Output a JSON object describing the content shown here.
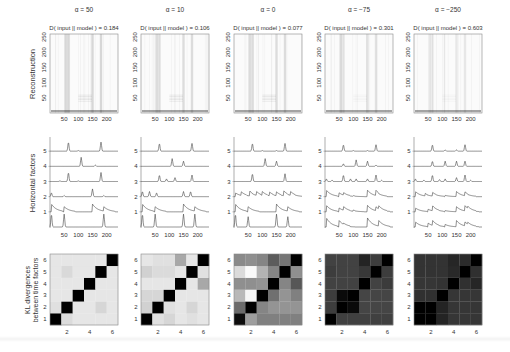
{
  "figure": {
    "row_labels": {
      "reconstruction": "Reconstruction",
      "horizontal_factors": "Horizontal factors",
      "kl_line1": "KL divergences",
      "kl_line2": "between time factors"
    },
    "columns": [
      {
        "alpha_label": "α = 50",
        "divergence_label": "D( input || model ) = 0.184"
      },
      {
        "alpha_label": "α = 10",
        "divergence_label": "D( input || model ) = 0.106"
      },
      {
        "alpha_label": "α = 0",
        "divergence_label": "D( input || model ) = 0.077"
      },
      {
        "alpha_label": "α = −75",
        "divergence_label": "D( input || model ) = 0.301"
      },
      {
        "alpha_label": "α = −250",
        "divergence_label": "D( input || model ) = 0.603"
      }
    ]
  },
  "chart_data": [
    {
      "type": "heatmap",
      "title": "Reconstruction",
      "panels": [
        "α = 50",
        "α = 10",
        "α = 0",
        "α = −75",
        "α = −250"
      ],
      "divergence": [
        0.184,
        0.106,
        0.077,
        0.301,
        0.603
      ],
      "xticks": [
        50,
        100,
        150,
        200
      ],
      "yticks": [
        50,
        100,
        150,
        200,
        250
      ],
      "xlim": [
        0,
        240
      ],
      "ylim": [
        0,
        260
      ],
      "dark_columns_x": [
        55,
        65,
        150,
        180
      ],
      "colormap": "gray (white = low)"
    },
    {
      "type": "line",
      "title": "Horizontal factors",
      "ylabel": "Horizontal factors",
      "yticks": [
        1,
        2,
        3,
        4,
        5
      ],
      "xticks": [
        50,
        100,
        150,
        200
      ],
      "xlim": [
        0,
        240
      ],
      "note": "Six stacked traces per panel (bottom unlabeled trace is the spike input); peak positions per trace estimated",
      "series": [
        {
          "panel": "α = 50",
          "traces": {
            "0": [
              [
                5,
                1
              ],
              [
                50,
                1
              ],
              [
                190,
                1
              ]
            ],
            "1": [
              [
                5,
                0.6
              ],
              [
                50,
                0.4
              ],
              [
                150,
                0.6
              ],
              [
                190,
                0.4
              ]
            ],
            "2": [
              [
                5,
                0.3
              ],
              [
                50,
                0.1
              ],
              [
                150,
                0.6
              ],
              [
                190,
                0.1
              ]
            ],
            "3": [
              [
                65,
                0.7
              ],
              [
                180,
                0.7
              ],
              [
                35,
                0.05
              ],
              [
                100,
                0.05
              ]
            ],
            "4": [
              [
                110,
                0.7
              ],
              [
                160,
                0.1
              ]
            ],
            "5": [
              [
                65,
                0.7
              ],
              [
                180,
                0.7
              ],
              [
                100,
                0.05
              ]
            ]
          }
        },
        {
          "panel": "α = 10",
          "traces": {
            "0": [
              [
                5,
                1
              ],
              [
                50,
                1
              ],
              [
                150,
                1
              ],
              [
                190,
                1
              ]
            ],
            "1": [
              [
                5,
                0.6
              ],
              [
                50,
                0.4
              ],
              [
                150,
                0.6
              ],
              [
                190,
                0.4
              ]
            ],
            "2": [
              [
                5,
                0.4
              ],
              [
                30,
                0.4
              ],
              [
                55,
                0.3
              ],
              [
                150,
                0.4
              ],
              [
                175,
                0.4
              ]
            ],
            "3": [
              [
                65,
                0.5
              ],
              [
                90,
                0.2
              ],
              [
                120,
                0.3
              ],
              [
                180,
                0.5
              ]
            ],
            "4": [
              [
                110,
                0.6
              ],
              [
                150,
                0.4
              ]
            ],
            "5": [
              [
                65,
                0.6
              ],
              [
                180,
                0.6
              ]
            ]
          }
        },
        {
          "panel": "α = 0",
          "traces": {
            "0": [
              [
                5,
                1
              ],
              [
                50,
                0.8
              ],
              [
                150,
                1
              ],
              [
                190,
                0.8
              ]
            ],
            "1": [
              [
                5,
                0.6
              ],
              [
                50,
                0.4
              ],
              [
                150,
                0.6
              ],
              [
                190,
                0.4
              ]
            ],
            "2": [
              [
                5,
                0.3
              ],
              [
                25,
                0.3
              ],
              [
                55,
                0.4
              ],
              [
                80,
                0.3
              ],
              [
                100,
                0.3
              ],
              [
                125,
                0.3
              ],
              [
                150,
                0.3
              ],
              [
                175,
                0.4
              ],
              [
                200,
                0.3
              ]
            ],
            "3": [
              [
                65,
                0.6
              ],
              [
                180,
                0.6
              ]
            ],
            "4": [
              [
                110,
                0.6
              ],
              [
                150,
                0.4
              ]
            ],
            "5": [
              [
                65,
                0.6
              ],
              [
                100,
                0.05
              ],
              [
                150,
                0.05
              ],
              [
                180,
                0.6
              ]
            ]
          }
        },
        {
          "panel": "α = −75",
          "traces": {
            "0": [
              [
                5,
                0.7
              ],
              [
                50,
                0.5
              ],
              [
                65,
                0.1
              ],
              [
                150,
                0.7
              ],
              [
                190,
                0.5
              ]
            ],
            "1": [
              [
                5,
                0.5
              ],
              [
                50,
                0.3
              ],
              [
                65,
                0.3
              ],
              [
                100,
                0.1
              ],
              [
                150,
                0.5
              ],
              [
                180,
                0.3
              ],
              [
                190,
                0.3
              ]
            ],
            "2": [
              [
                5,
                0.5
              ],
              [
                50,
                0.3
              ],
              [
                65,
                0.2
              ],
              [
                100,
                0.05
              ],
              [
                150,
                0.5
              ],
              [
                180,
                0.4
              ]
            ],
            "3": [
              [
                5,
                0.2
              ],
              [
                25,
                0.1
              ],
              [
                65,
                0.5
              ],
              [
                90,
                0.2
              ],
              [
                110,
                0.2
              ],
              [
                150,
                0.2
              ],
              [
                180,
                0.5
              ],
              [
                200,
                0.1
              ]
            ],
            "4": [
              [
                65,
                0.2
              ],
              [
                110,
                0.5
              ],
              [
                150,
                0.4
              ],
              [
                180,
                0.1
              ]
            ],
            "5": [
              [
                65,
                0.5
              ],
              [
                100,
                0.05
              ],
              [
                150,
                0.05
              ],
              [
                180,
                0.5
              ]
            ]
          }
        },
        {
          "panel": "α = −250",
          "traces": {
            "0": [
              [
                5,
                0.4
              ],
              [
                50,
                0.3
              ],
              [
                65,
                0.4
              ],
              [
                110,
                0.2
              ],
              [
                150,
                0.5
              ],
              [
                180,
                0.3
              ],
              [
                190,
                0.2
              ]
            ],
            "1": [
              [
                5,
                0.3
              ],
              [
                50,
                0.2
              ],
              [
                65,
                0.4
              ],
              [
                110,
                0.1
              ],
              [
                150,
                0.4
              ],
              [
                180,
                0.4
              ],
              [
                190,
                0.2
              ]
            ],
            "2": [
              [
                5,
                0.4
              ],
              [
                40,
                0.2
              ],
              [
                65,
                0.3
              ],
              [
                110,
                0.1
              ],
              [
                150,
                0.4
              ],
              [
                180,
                0.3
              ]
            ],
            "3": [
              [
                5,
                0.2
              ],
              [
                35,
                0.1
              ],
              [
                65,
                0.5
              ],
              [
                90,
                0.15
              ],
              [
                110,
                0.2
              ],
              [
                150,
                0.3
              ],
              [
                180,
                0.5
              ],
              [
                200,
                0.1
              ]
            ],
            "4": [
              [
                65,
                0.4
              ],
              [
                110,
                0.4
              ],
              [
                150,
                0.4
              ],
              [
                180,
                0.4
              ]
            ],
            "5": [
              [
                65,
                0.5
              ],
              [
                110,
                0.1
              ],
              [
                150,
                0.1
              ],
              [
                180,
                0.5
              ]
            ]
          }
        }
      ]
    },
    {
      "type": "heatmap",
      "title": "KL divergences between time factors",
      "xticks": [
        2,
        4,
        6
      ],
      "yticks": [
        1,
        2,
        3,
        4,
        5,
        6
      ],
      "note": "Grey level per cell (0 = black, 1 = white); rows listed from factor 1 (bottom) to 6 (top)",
      "matrices": [
        {
          "panel": "α = 50",
          "values": [
            [
              0.0,
              0.86,
              0.9,
              0.9,
              0.9,
              0.9
            ],
            [
              0.88,
              0.0,
              0.9,
              0.9,
              0.84,
              0.9
            ],
            [
              0.9,
              0.9,
              0.0,
              0.9,
              0.9,
              0.9
            ],
            [
              0.9,
              0.9,
              0.9,
              0.0,
              0.9,
              0.9
            ],
            [
              0.9,
              0.85,
              0.9,
              0.9,
              0.0,
              0.9
            ],
            [
              0.9,
              0.9,
              0.9,
              0.9,
              0.9,
              0.0
            ]
          ]
        },
        {
          "panel": "α = 10",
          "values": [
            [
              0.0,
              0.88,
              0.84,
              0.9,
              0.88,
              0.9
            ],
            [
              0.82,
              0.0,
              0.88,
              0.9,
              0.84,
              0.9
            ],
            [
              0.84,
              0.84,
              0.0,
              0.9,
              0.9,
              0.9
            ],
            [
              0.9,
              0.9,
              0.9,
              0.0,
              0.9,
              0.66
            ],
            [
              0.82,
              0.86,
              0.86,
              0.9,
              0.0,
              0.88
            ],
            [
              0.9,
              0.88,
              0.88,
              0.66,
              0.9,
              0.0
            ]
          ]
        },
        {
          "panel": "α = 0",
          "values": [
            [
              0.05,
              0.62,
              0.5,
              0.5,
              0.5,
              0.5
            ],
            [
              0.42,
              0.0,
              0.52,
              0.58,
              0.58,
              0.58
            ],
            [
              0.72,
              0.96,
              0.0,
              0.44,
              0.58,
              0.5
            ],
            [
              0.56,
              0.56,
              0.58,
              0.0,
              0.52,
              0.34
            ],
            [
              0.86,
              0.98,
              0.7,
              0.52,
              0.0,
              0.56
            ],
            [
              0.54,
              0.56,
              0.52,
              0.36,
              0.46,
              0.0
            ]
          ]
        },
        {
          "panel": "α = −75",
          "values": [
            [
              0.0,
              0.25,
              0.25,
              0.25,
              0.25,
              0.25
            ],
            [
              0.24,
              0.0,
              0.04,
              0.27,
              0.27,
              0.27
            ],
            [
              0.24,
              0.04,
              0.0,
              0.27,
              0.27,
              0.27
            ],
            [
              0.26,
              0.26,
              0.26,
              0.0,
              0.26,
              0.23
            ],
            [
              0.24,
              0.26,
              0.26,
              0.22,
              0.0,
              0.24
            ],
            [
              0.26,
              0.26,
              0.26,
              0.14,
              0.24,
              0.0
            ]
          ]
        },
        {
          "panel": "α = −250",
          "values": [
            [
              0.0,
              0.0,
              0.14,
              0.21,
              0.21,
              0.21
            ],
            [
              0.0,
              0.0,
              0.14,
              0.21,
              0.21,
              0.21
            ],
            [
              0.19,
              0.19,
              0.0,
              0.21,
              0.21,
              0.21
            ],
            [
              0.21,
              0.21,
              0.2,
              0.0,
              0.19,
              0.15
            ],
            [
              0.2,
              0.2,
              0.2,
              0.16,
              0.0,
              0.19
            ],
            [
              0.2,
              0.2,
              0.2,
              0.15,
              0.17,
              0.0
            ]
          ]
        }
      ]
    }
  ]
}
